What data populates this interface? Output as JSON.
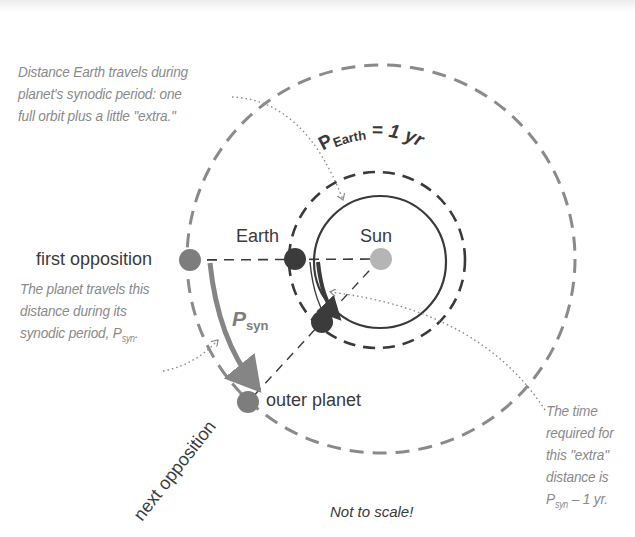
{
  "diagram": {
    "type": "synodic-period-geometry",
    "colors": {
      "outer_orbit": "#8a8a8a",
      "earth_orbit": "#3a3a3a",
      "sun": "#b5b5b5",
      "earth": "#3b3b3b",
      "planet": "#7d7d7d",
      "arrow": "#858585",
      "note_text": "#8a8a8a",
      "label_text": "#3a3a3a"
    },
    "orbit_labels": {
      "outer_symbol": "P",
      "outer_sub": "orb",
      "outer_text": "= planet's orbital period",
      "earth_symbol": "P",
      "earth_sub": "Earth",
      "earth_text": "= 1 yr"
    },
    "bodies": {
      "sun": "Sun",
      "earth": "Earth",
      "first_opposition": "first opposition",
      "outer_planet": "outer planet",
      "next_opposition": "next opposition"
    },
    "psyn_label": {
      "symbol": "P",
      "sub": "syn"
    },
    "notes": {
      "earth_distance": [
        "Distance Earth travels during",
        "planet's synodic period: one",
        "full orbit plus a little \"extra.\""
      ],
      "planet_distance": [
        "The planet travels this",
        "distance during its",
        "synodic period, "
      ],
      "planet_distance_sym": "P",
      "planet_distance_sub": "syn",
      "planet_distance_end": ".",
      "extra_time": [
        "The time",
        "required for",
        "this \"extra\"",
        "distance is"
      ],
      "extra_time_sym": "P",
      "extra_time_sub": "syn",
      "extra_time_end": " – 1 yr.",
      "not_to_scale": "Not to scale!"
    }
  }
}
